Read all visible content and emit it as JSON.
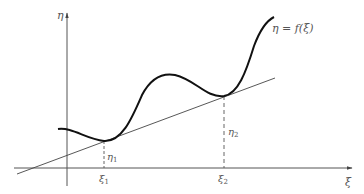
{
  "diagram": {
    "y_axis_label": "η",
    "x_axis_label": "ξ",
    "curve_label": "η = f(ξ)",
    "points": [
      {
        "x_label": "ξ",
        "x_sub": "1",
        "y_label": "η",
        "y_sub": "1"
      },
      {
        "x_label": "ξ",
        "x_sub": "2",
        "y_label": "η",
        "y_sub": "2"
      }
    ],
    "colors": {
      "curve": "#111111",
      "axis": "#555555",
      "line": "#444444",
      "text": "#555555"
    }
  }
}
